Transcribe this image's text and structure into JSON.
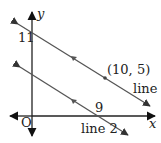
{
  "diagram": {
    "axes": {
      "x_label": "x",
      "y_label": "y",
      "origin_label": "O"
    },
    "lines": [
      {
        "name": "line 1",
        "y_intercept_label": "11",
        "point_label": "(10, 5)"
      },
      {
        "name": "line 2",
        "x_intercept_label": "9"
      }
    ],
    "colors": {
      "axis": "#222222",
      "line": "#555555",
      "text": "#222222"
    }
  }
}
